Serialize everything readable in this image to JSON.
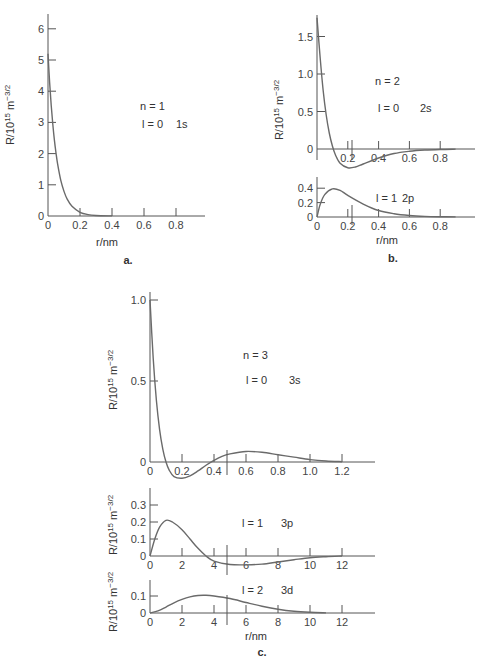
{
  "chart_data": [
    {
      "id": "a",
      "type": "line",
      "caption": "a.",
      "xlabel": "r/nm",
      "ylabel": "R/10¹⁵ m⁻³/²",
      "xlim": [
        0,
        1.0
      ],
      "ylim": [
        0,
        6.5
      ],
      "xticks": [
        "0",
        "0.2",
        "0.4",
        "0.6",
        "0.8"
      ],
      "yticks": [
        "0",
        "1",
        "2",
        "3",
        "4",
        "5",
        "6"
      ],
      "annotations": [
        "n = 1",
        "l = 0    1s"
      ],
      "series": [
        {
          "name": "1s",
          "x": [
            0,
            0.01,
            0.02,
            0.03,
            0.04,
            0.05,
            0.06,
            0.08,
            0.1,
            0.12,
            0.15,
            0.2,
            0.25,
            0.3,
            0.4
          ],
          "y": [
            5.2,
            4.29,
            3.55,
            2.94,
            2.43,
            2.02,
            1.67,
            1.14,
            0.79,
            0.54,
            0.31,
            0.12,
            0.046,
            0.018,
            0.003
          ]
        }
      ]
    },
    {
      "id": "b-2s",
      "type": "line",
      "caption": "b.",
      "xlabel": "r/nm",
      "ylabel": "R/10¹⁵ m⁻³/²",
      "xlim": [
        0,
        1.0
      ],
      "ylim": [
        -0.3,
        1.8
      ],
      "xticks": [
        "0.2",
        "0.4",
        "0.6",
        "0.8"
      ],
      "yticks": [
        "0",
        "0.5",
        "1.0",
        "1.5"
      ],
      "annotations": [
        "n = 2",
        "l = 0    2s"
      ],
      "series": [
        {
          "name": "2s",
          "x": [
            0,
            0.02,
            0.04,
            0.06,
            0.08,
            0.1,
            0.12,
            0.15,
            0.2,
            0.25,
            0.3,
            0.4,
            0.5,
            0.6,
            0.7,
            0.8,
            0.9
          ],
          "y": [
            1.75,
            1.23,
            0.78,
            0.45,
            0.21,
            0.04,
            -0.08,
            -0.19,
            -0.25,
            -0.24,
            -0.2,
            -0.12,
            -0.06,
            -0.03,
            -0.014,
            -0.006,
            -0.002
          ]
        }
      ]
    },
    {
      "id": "b-2p",
      "type": "line",
      "xlabel": "r/nm",
      "xlim": [
        0,
        1.0
      ],
      "ylim": [
        0,
        0.5
      ],
      "xticks": [
        "0",
        "0.2",
        "0.4",
        "0.6",
        "0.8"
      ],
      "yticks": [
        "0",
        "0.2",
        "0.4"
      ],
      "annotations": [
        "l = 1  2p"
      ],
      "series": [
        {
          "name": "2p",
          "x": [
            0,
            0.02,
            0.05,
            0.1,
            0.15,
            0.2,
            0.3,
            0.4,
            0.5,
            0.6,
            0.7,
            0.8,
            0.9
          ],
          "y": [
            0,
            0.17,
            0.31,
            0.39,
            0.37,
            0.3,
            0.18,
            0.09,
            0.045,
            0.021,
            0.009,
            0.004,
            0.002
          ]
        }
      ]
    },
    {
      "id": "c-3s",
      "type": "line",
      "caption": "c.",
      "ylabel": "R/10¹⁵ m⁻³/²",
      "xlim": [
        0,
        1.4
      ],
      "ylim": [
        -0.12,
        1.05
      ],
      "xticks": [
        "0",
        "0.2",
        "0.4",
        "0.6",
        "0.8",
        "1.0",
        "1.2"
      ],
      "yticks": [
        "0",
        "0.5",
        "1.0"
      ],
      "annotations": [
        "n = 3",
        "l = 0    3s"
      ],
      "series": [
        {
          "name": "3s",
          "x": [
            0,
            0.02,
            0.04,
            0.06,
            0.08,
            0.1,
            0.12,
            0.15,
            0.2,
            0.25,
            0.3,
            0.35,
            0.4,
            0.45,
            0.5,
            0.6,
            0.7,
            0.8,
            0.9,
            1.0,
            1.1,
            1.2
          ],
          "y": [
            1.0,
            0.64,
            0.38,
            0.2,
            0.08,
            0.0,
            -0.05,
            -0.09,
            -0.1,
            -0.085,
            -0.055,
            -0.02,
            0.01,
            0.035,
            0.05,
            0.065,
            0.06,
            0.045,
            0.03,
            0.015,
            0.006,
            0.002
          ]
        }
      ]
    },
    {
      "id": "c-3p",
      "type": "line",
      "ylabel": "R/10¹⁵ m⁻³/²",
      "xlim": [
        0,
        14
      ],
      "ylim": [
        -0.06,
        0.38
      ],
      "xticks": [
        "0",
        "2",
        "4",
        "6",
        "8",
        "10",
        "12"
      ],
      "yticks": [
        "0",
        "0.1",
        "0.2",
        "0.3"
      ],
      "annotations": [
        "l = 1      3p"
      ],
      "series": [
        {
          "name": "3p",
          "x": [
            0,
            0.3,
            0.6,
            1,
            1.4,
            2,
            2.5,
            3,
            3.5,
            4,
            5,
            6,
            7,
            8,
            9,
            10,
            11,
            12
          ],
          "y": [
            0,
            0.1,
            0.17,
            0.21,
            0.2,
            0.155,
            0.1,
            0.045,
            0.0,
            -0.03,
            -0.05,
            -0.052,
            -0.048,
            -0.035,
            -0.022,
            -0.01,
            -0.004,
            0
          ]
        }
      ]
    },
    {
      "id": "c-3d",
      "type": "line",
      "xlabel": "r/nm",
      "ylabel": "R/10¹⁵ m⁻³/²",
      "xlim": [
        0,
        14
      ],
      "ylim": [
        0,
        0.17
      ],
      "xticks": [
        "0",
        "2",
        "4",
        "6",
        "8",
        "10",
        "12"
      ],
      "yticks": [
        "0",
        "0.1"
      ],
      "annotations": [
        "l = 2      3d"
      ],
      "series": [
        {
          "name": "3d",
          "x": [
            0,
            0.5,
            1,
            1.5,
            2,
            2.5,
            3,
            3.5,
            4,
            5,
            6,
            7,
            8,
            9,
            10,
            11
          ],
          "y": [
            0,
            0.012,
            0.035,
            0.06,
            0.08,
            0.095,
            0.103,
            0.104,
            0.1,
            0.085,
            0.062,
            0.04,
            0.022,
            0.01,
            0.004,
            0.001
          ]
        }
      ]
    }
  ],
  "labels": {
    "a": {
      "caption": "a.",
      "xlabel": "r/nm",
      "ylabel": "R/10",
      "ylabel_exp": "15",
      "ylabel_unit": " m",
      "ylabel_unit_exp": "−3/2",
      "n": "n = 1",
      "l": "l = 0",
      "orbital": "1s"
    },
    "b": {
      "caption": "b.",
      "xlabel": "r/nm",
      "n": "n = 2",
      "l0": "l = 0",
      "orb0": "2s",
      "l1": "l = 1",
      "orb1": "2p"
    },
    "c": {
      "caption": "c.",
      "xlabel": "r/nm",
      "n": "n = 3",
      "l0": "l = 0",
      "orb0": "3s",
      "l1": "l = 1",
      "orb1": "3p",
      "l2": "l = 2",
      "orb2": "3d"
    }
  }
}
